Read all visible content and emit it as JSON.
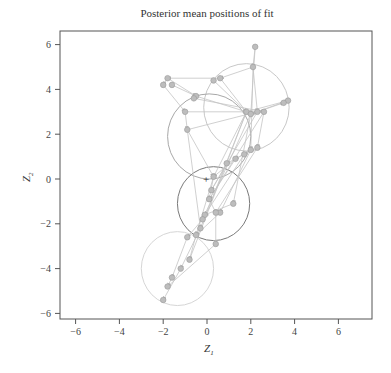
{
  "chart_data": {
    "type": "scatter",
    "title": "Posterior mean positions of fit",
    "xlabel": "Z",
    "xlabel_sub": "1",
    "ylabel": "Z",
    "ylabel_sub": "2",
    "xlim": [
      -6.6,
      7.6
    ],
    "ylim": [
      -6.3,
      6.6
    ],
    "x_ticks": [
      -6,
      -4,
      -2,
      0,
      2,
      4,
      6
    ],
    "y_ticks": [
      -6,
      -4,
      -2,
      0,
      2,
      4,
      6
    ],
    "grid": false,
    "legend": null,
    "clusters": [
      {
        "name": "cluster-1",
        "center": [
          1.8,
          3.2
        ],
        "radius": 1.95,
        "color": "#c8c8c8"
      },
      {
        "name": "cluster-2",
        "center": [
          0.1,
          1.9
        ],
        "radius": 1.9,
        "color": "#a8a8a8"
      },
      {
        "name": "cluster-3",
        "center": [
          0.3,
          -1.1
        ],
        "radius": 1.65,
        "color": "#7a7a7a"
      },
      {
        "name": "cluster-4",
        "center": [
          -1.35,
          -4.0
        ],
        "radius": 1.65,
        "color": "#d6d6d6"
      }
    ],
    "nodes": [
      [
        2.2,
        5.9
      ],
      [
        2.1,
        5.0
      ],
      [
        -1.8,
        4.5
      ],
      [
        -2.0,
        4.2
      ],
      [
        -1.6,
        4.2
      ],
      [
        0.6,
        4.5
      ],
      [
        0.3,
        4.4
      ],
      [
        -0.5,
        3.7
      ],
      [
        -0.6,
        3.6
      ],
      [
        -1.0,
        3.0
      ],
      [
        1.8,
        3.0
      ],
      [
        2.0,
        2.9
      ],
      [
        2.3,
        3.0
      ],
      [
        2.6,
        3.0
      ],
      [
        3.7,
        3.5
      ],
      [
        3.5,
        3.4
      ],
      [
        -0.9,
        2.2
      ],
      [
        2.3,
        1.4
      ],
      [
        2.0,
        1.3
      ],
      [
        1.7,
        1.1
      ],
      [
        1.3,
        0.9
      ],
      [
        0.9,
        0.7
      ],
      [
        0.3,
        0.1
      ],
      [
        0.2,
        -0.5
      ],
      [
        0.1,
        -0.9
      ],
      [
        1.2,
        -1.1
      ],
      [
        0.6,
        -1.5
      ],
      [
        0.4,
        -1.5
      ],
      [
        -0.1,
        -1.6
      ],
      [
        -0.2,
        -1.8
      ],
      [
        -0.3,
        -2.2
      ],
      [
        -0.5,
        -2.5
      ],
      [
        -0.9,
        -2.6
      ],
      [
        0.4,
        -2.9
      ],
      [
        -0.8,
        -3.6
      ],
      [
        -1.2,
        -4.0
      ],
      [
        -1.6,
        -4.4
      ],
      [
        -1.8,
        -4.8
      ],
      [
        -2.0,
        -5.4
      ]
    ],
    "edges": [
      [
        0,
        1
      ],
      [
        1,
        5
      ],
      [
        5,
        2
      ],
      [
        2,
        3
      ],
      [
        3,
        9
      ],
      [
        9,
        16
      ],
      [
        4,
        7
      ],
      [
        7,
        10
      ],
      [
        5,
        10
      ],
      [
        1,
        12
      ],
      [
        1,
        18
      ],
      [
        0,
        11
      ],
      [
        10,
        14
      ],
      [
        12,
        15
      ],
      [
        9,
        10
      ],
      [
        16,
        12
      ],
      [
        16,
        22
      ],
      [
        10,
        22
      ],
      [
        11,
        25
      ],
      [
        12,
        23
      ],
      [
        13,
        24
      ],
      [
        10,
        30
      ],
      [
        11,
        29
      ],
      [
        17,
        27
      ],
      [
        18,
        26
      ],
      [
        19,
        28
      ],
      [
        20,
        24
      ],
      [
        21,
        23
      ],
      [
        22,
        24
      ],
      [
        24,
        27
      ],
      [
        25,
        28
      ],
      [
        26,
        31
      ],
      [
        27,
        33
      ],
      [
        22,
        31
      ],
      [
        29,
        32
      ],
      [
        30,
        35
      ],
      [
        31,
        34
      ],
      [
        32,
        36
      ],
      [
        33,
        37
      ],
      [
        35,
        38
      ],
      [
        36,
        37
      ],
      [
        2,
        7
      ],
      [
        6,
        10
      ],
      [
        8,
        13
      ],
      [
        13,
        17
      ],
      [
        14,
        11
      ],
      [
        16,
        30
      ],
      [
        17,
        19
      ],
      [
        18,
        20
      ],
      [
        19,
        21
      ],
      [
        20,
        22
      ],
      [
        10,
        34
      ]
    ],
    "marker": {
      "label": "+",
      "position": [
        0.0,
        0.0
      ]
    }
  }
}
